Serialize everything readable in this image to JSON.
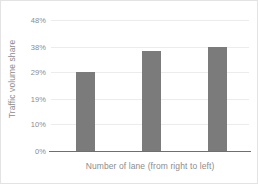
{
  "chart_data": {
    "type": "bar",
    "title": "",
    "categories": [
      "1",
      "2",
      "3"
    ],
    "values": [
      28.8,
      36.6,
      38.1
    ],
    "series": [
      {
        "name": "Traffic volume share",
        "values": [
          28.8,
          36.6,
          38.1
        ]
      }
    ],
    "xlabel": "Number of  lane (from right to left)",
    "ylabel": "Traffic volume share",
    "ylim": [
      0,
      48
    ],
    "yticks": [
      0,
      10,
      19,
      29,
      38,
      48
    ],
    "ytick_labels": [
      "0%",
      "10%",
      "19%",
      "29%",
      "38%",
      "48%"
    ],
    "xtick_labels": [
      "",
      "",
      ""
    ],
    "grid": true,
    "legend": false,
    "bar_color": "#7b7b7b",
    "gridline_color": "#ececec",
    "axis_color": "#6f6f6f",
    "text_color": "#8c8c8c",
    "background": "#ffffff"
  }
}
